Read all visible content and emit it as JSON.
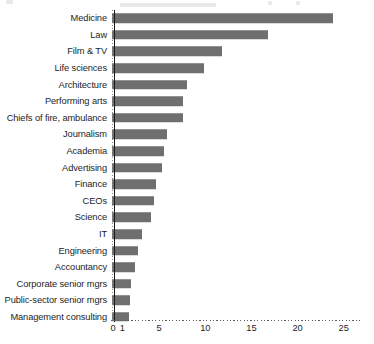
{
  "chart_data": {
    "type": "bar",
    "orientation": "horizontal",
    "title": "",
    "subtitle": "",
    "xlabel": "",
    "ylabel": "",
    "xlim": [
      0,
      26
    ],
    "grid": "dotted-x-axis",
    "legend": "none",
    "bar_color": "#6f6f6f",
    "categories": [
      "Medicine",
      "Law",
      "Film & TV",
      "Life sciences",
      "Architecture",
      "Performing arts",
      "Chiefs of fire, ambulance",
      "Journalism",
      "Academia",
      "Advertising",
      "Finance",
      "CEOs",
      "Science",
      "IT",
      "Engineering",
      "Accountancy",
      "Corporate senior mgrs",
      "Public-sector senior mgrs",
      "Management consulting"
    ],
    "values": [
      24,
      17,
      12,
      10,
      8.2,
      7.8,
      7.7,
      6,
      5.7,
      5.5,
      4.8,
      4.6,
      4.3,
      3.3,
      2.9,
      2.6,
      2.1,
      2.0,
      1.9
    ],
    "xticks": [
      0,
      1,
      5,
      10,
      15,
      20,
      25
    ],
    "xtick_labels": [
      "0",
      "1",
      "5",
      "10",
      "15",
      "20",
      "25"
    ]
  }
}
